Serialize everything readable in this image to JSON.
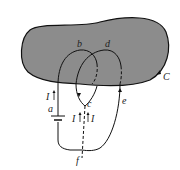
{
  "diagram": {
    "surface": {
      "fill": "#8c8c8c",
      "stroke": "#111111"
    },
    "labels": {
      "b": "b",
      "d": "d",
      "C": "C",
      "a": "a",
      "c": "c",
      "e": "e",
      "f": "f",
      "I_left": "I",
      "I_mid_left": "I",
      "I_mid_right": "I"
    }
  }
}
